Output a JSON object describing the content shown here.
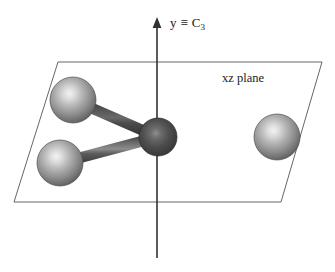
{
  "figure": {
    "width": 335,
    "height": 272,
    "background": "#ffffff",
    "caption_texts": {
      "axis_label_main": "y",
      "axis_label_equiv": "≡",
      "axis_label_symmetry": "C",
      "axis_label_symmetry_order": "3",
      "plane_label": "xz plane"
    }
  },
  "chart_data": {
    "type": "diagram",
    "subtype": "molecular-structure-symmetry",
    "title": "",
    "annotations": [
      {
        "name": "y-axis-label",
        "text": "y ≡ C3",
        "x": 170,
        "y": 24
      },
      {
        "name": "xz-plane-label",
        "text": "xz plane",
        "x": 222,
        "y": 80
      }
    ],
    "axes": [
      {
        "name": "c3-axis",
        "label": "y ≡ C3",
        "orientation": "vertical",
        "x": 157,
        "y_top": 18,
        "y_bottom": 258,
        "arrow_at": "top",
        "color": "#333333"
      }
    ],
    "plane": {
      "name": "xz-plane",
      "label": "xz plane",
      "shape": "parallelogram",
      "stroke": "#666666",
      "fill": "none",
      "points": [
        {
          "x": 58,
          "y": 62
        },
        {
          "x": 322,
          "y": 62
        },
        {
          "x": 281,
          "y": 202
        },
        {
          "x": 14,
          "y": 202
        }
      ]
    },
    "atoms": [
      {
        "name": "central-atom",
        "role": "center",
        "cx": 158,
        "cy": 137,
        "r": 19,
        "color": "#4a4a4a",
        "highlight": "#8a8a8a",
        "shade": "dark"
      },
      {
        "name": "ligand-atom-upper-left",
        "role": "ligand",
        "cx": 73,
        "cy": 100,
        "r": 23,
        "color": "#9a9a9a",
        "highlight": "#e8e8e8",
        "shade": "light"
      },
      {
        "name": "ligand-atom-lower-left",
        "role": "ligand",
        "cx": 60,
        "cy": 163,
        "r": 23,
        "color": "#9a9a9a",
        "highlight": "#e8e8e8",
        "shade": "light"
      },
      {
        "name": "ligand-atom-right",
        "role": "ligand",
        "cx": 277,
        "cy": 137,
        "r": 23,
        "color": "#9a9a9a",
        "highlight": "#e8e8e8",
        "shade": "light"
      }
    ],
    "bonds": [
      {
        "name": "bond-center-upper-left",
        "from": "central-atom",
        "to": "ligand-atom-upper-left",
        "x1": 158,
        "y1": 137,
        "x2": 73,
        "y2": 100,
        "width": 11,
        "shade": "dark",
        "color": "#4f4f4f"
      },
      {
        "name": "bond-center-lower-left",
        "from": "central-atom",
        "to": "ligand-atom-lower-left",
        "x1": 158,
        "y1": 137,
        "x2": 60,
        "y2": 163,
        "width": 11,
        "shade": "medium",
        "color": "#5a5a5a"
      },
      {
        "name": "bond-center-right",
        "from": "central-atom",
        "to": "ligand-atom-right",
        "x1": 158,
        "y1": 137,
        "x2": 277,
        "y2": 137,
        "width": 12,
        "shade": "light",
        "color": "#6f6f6f"
      }
    ],
    "colors": {
      "background": "#ffffff",
      "plane_stroke": "#666666",
      "axis": "#333333",
      "central_atom": "#4a4a4a",
      "ligand_atom": "#9a9a9a",
      "text": "#1a1a1a"
    },
    "grid": false,
    "legend": null
  }
}
